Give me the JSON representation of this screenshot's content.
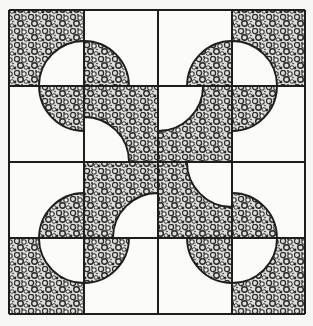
{
  "diagram": {
    "type": "quilt-block-pattern",
    "grid": {
      "rows": 4,
      "cols": 4
    },
    "colors": {
      "background": "#f7f7f5",
      "line": "#1e1e1e",
      "light": "#fbfbfa",
      "stipple_dark": "#2a2a2a",
      "stipple_light": "#d9d9d6"
    },
    "tile_legend": {
      "bg": "tile background: 'stipple' or 'white'",
      "corner": "corner the quarter-circle is centered on: tl, tr, bl, br"
    },
    "tiles": [
      [
        {
          "bg": "stipple",
          "corner": "br"
        },
        {
          "bg": "white",
          "corner": "bl"
        },
        {
          "bg": "white",
          "corner": "br"
        },
        {
          "bg": "stipple",
          "corner": "bl"
        }
      ],
      [
        {
          "bg": "white",
          "corner": "tr"
        },
        {
          "bg": "stipple",
          "corner": "bl"
        },
        {
          "bg": "stipple",
          "corner": "tl"
        },
        {
          "bg": "white",
          "corner": "tl"
        }
      ],
      [
        {
          "bg": "white",
          "corner": "br"
        },
        {
          "bg": "stipple",
          "corner": "br"
        },
        {
          "bg": "stipple",
          "corner": "tr"
        },
        {
          "bg": "white",
          "corner": "bl"
        }
      ],
      [
        {
          "bg": "stipple",
          "corner": "tr"
        },
        {
          "bg": "white",
          "corner": "tl"
        },
        {
          "bg": "white",
          "corner": "tr"
        },
        {
          "bg": "stipple",
          "corner": "tl"
        }
      ]
    ]
  }
}
